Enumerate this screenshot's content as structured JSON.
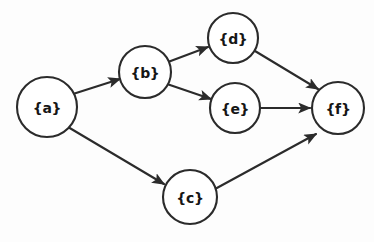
{
  "diagram": {
    "background_color": "#fdfdfd",
    "stroke_color": "#2b2b2b",
    "label_color": "#161616",
    "nodes": [
      {
        "id": "a",
        "label": "{a}",
        "cx": 47,
        "cy": 107,
        "r": 30
      },
      {
        "id": "b",
        "label": "{b}",
        "cx": 145,
        "cy": 72,
        "r": 26
      },
      {
        "id": "c",
        "label": "{c}",
        "cx": 190,
        "cy": 197,
        "r": 27
      },
      {
        "id": "d",
        "label": "{d}",
        "cx": 233,
        "cy": 38,
        "r": 25
      },
      {
        "id": "e",
        "label": "{e}",
        "cx": 235,
        "cy": 108,
        "r": 25
      },
      {
        "id": "f",
        "label": "{f}",
        "cx": 338,
        "cy": 108,
        "r": 26
      }
    ],
    "edges": [
      {
        "id": "a-b",
        "from": "a",
        "to": "b",
        "x1": 73,
        "y1": 94,
        "x2": 120,
        "y2": 79
      },
      {
        "id": "a-c",
        "from": "a",
        "to": "c",
        "x1": 68,
        "y1": 127,
        "x2": 164,
        "y2": 184
      },
      {
        "id": "b-d",
        "from": "b",
        "to": "d",
        "x1": 168,
        "y1": 62,
        "x2": 208,
        "y2": 47
      },
      {
        "id": "b-e",
        "from": "b",
        "to": "e",
        "x1": 167,
        "y1": 84,
        "x2": 211,
        "y2": 99
      },
      {
        "id": "d-f",
        "from": "d",
        "to": "f",
        "x1": 255,
        "y1": 51,
        "x2": 318,
        "y2": 89
      },
      {
        "id": "e-f",
        "from": "e",
        "to": "f",
        "x1": 261,
        "y1": 108,
        "x2": 310,
        "y2": 108
      },
      {
        "id": "c-f",
        "from": "c",
        "to": "f",
        "x1": 215,
        "y1": 189,
        "x2": 316,
        "y2": 134
      }
    ]
  }
}
